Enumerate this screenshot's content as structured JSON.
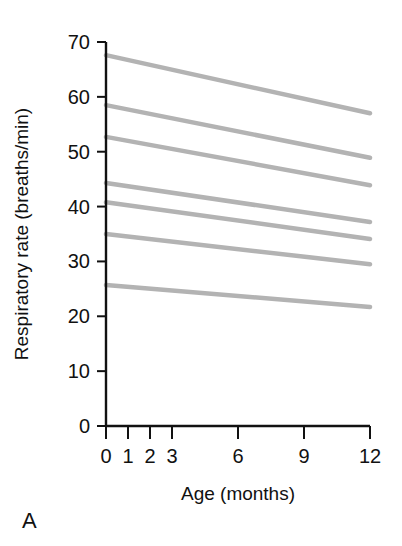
{
  "panel": {
    "letter": "A"
  },
  "chart_data": {
    "type": "line",
    "title": "",
    "subtitle": "",
    "xlabel": "Age (months)",
    "ylabel": "Respiratory rate (breaths/min)",
    "xlim": [
      0,
      12
    ],
    "ylim": [
      0,
      70
    ],
    "xticks": [
      0,
      1,
      2,
      3,
      6,
      9,
      12
    ],
    "xticklabels": [
      "0",
      "1",
      "2",
      "3",
      "6",
      "9",
      "12"
    ],
    "yticks": [
      0,
      10,
      20,
      30,
      40,
      50,
      60,
      70
    ],
    "yticklabels": [
      "0",
      "10",
      "20",
      "30",
      "40",
      "50",
      "60",
      "70"
    ],
    "grid": false,
    "legend": "none",
    "line_color": "#b3b3b3",
    "line_width": 4.5,
    "x": [
      0,
      12
    ],
    "series": [
      {
        "name": "centile-1",
        "values": [
          67.6,
          57.0
        ]
      },
      {
        "name": "centile-2",
        "values": [
          58.5,
          48.9
        ]
      },
      {
        "name": "centile-3",
        "values": [
          52.7,
          43.9
        ]
      },
      {
        "name": "centile-4",
        "values": [
          44.3,
          37.2
        ]
      },
      {
        "name": "centile-5",
        "values": [
          40.8,
          34.1
        ]
      },
      {
        "name": "centile-6",
        "values": [
          35.0,
          29.5
        ]
      },
      {
        "name": "centile-7",
        "values": [
          25.7,
          21.7
        ]
      }
    ]
  }
}
